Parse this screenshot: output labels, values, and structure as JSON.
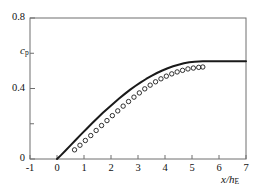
{
  "chart_data": {
    "type": "line",
    "title": "",
    "xlabel": "x/h_E",
    "xlabel_main": "x/h",
    "xlabel_sub": "E",
    "ylabel": "c_p",
    "ylabel_main": "c",
    "ylabel_sub": "p",
    "xlim": [
      -1,
      7
    ],
    "ylim": [
      0,
      0.8
    ],
    "xticks": [
      -1,
      0,
      1,
      2,
      3,
      4,
      5,
      6,
      7
    ],
    "xticklabels": [
      "-1",
      "0",
      "1",
      "2",
      "3",
      "4",
      "5",
      "6",
      "7"
    ],
    "yticks": [
      0,
      0.2,
      0.4,
      0.6,
      0.8
    ],
    "yticklabels": [
      "0",
      "",
      "0.4",
      "",
      "0.8"
    ],
    "grid": false,
    "legend": null,
    "series": [
      {
        "name": "computation",
        "style": "solid-line",
        "color": "#1a1a1a",
        "linewidth": 2.0,
        "x": [
          0.0,
          0.15,
          0.3,
          0.5,
          0.7,
          0.9,
          1.1,
          1.3,
          1.5,
          1.7,
          1.9,
          2.1,
          2.3,
          2.5,
          2.7,
          2.9,
          3.1,
          3.3,
          3.5,
          3.7,
          3.9,
          4.1,
          4.3,
          4.5,
          4.7,
          4.9,
          5.1,
          5.4,
          5.8,
          6.2,
          6.6,
          7.0
        ],
        "y": [
          0.0,
          0.022,
          0.045,
          0.077,
          0.109,
          0.141,
          0.172,
          0.203,
          0.233,
          0.262,
          0.29,
          0.317,
          0.343,
          0.368,
          0.392,
          0.414,
          0.435,
          0.454,
          0.472,
          0.488,
          0.502,
          0.515,
          0.526,
          0.535,
          0.543,
          0.549,
          0.552,
          0.554,
          0.555,
          0.555,
          0.555,
          0.555
        ]
      },
      {
        "name": "measurement",
        "style": "open-circles",
        "color": "#1a1a1a",
        "marker_size": 4.4,
        "x": [
          0.65,
          0.85,
          1.05,
          1.25,
          1.45,
          1.65,
          1.85,
          2.05,
          2.25,
          2.45,
          2.65,
          2.85,
          3.05,
          3.25,
          3.45,
          3.65,
          3.85,
          4.05,
          4.25,
          4.45,
          4.65,
          4.85,
          5.05,
          5.25,
          5.4
        ],
        "y": [
          0.052,
          0.078,
          0.105,
          0.133,
          0.162,
          0.19,
          0.218,
          0.246,
          0.273,
          0.3,
          0.326,
          0.351,
          0.375,
          0.398,
          0.419,
          0.438,
          0.455,
          0.47,
          0.483,
          0.494,
          0.503,
          0.511,
          0.516,
          0.52,
          0.522
        ]
      }
    ]
  },
  "axes": {
    "frame_color": "#6e6e6e",
    "tick_color": "#6e6e6e",
    "background": "#ffffff"
  }
}
